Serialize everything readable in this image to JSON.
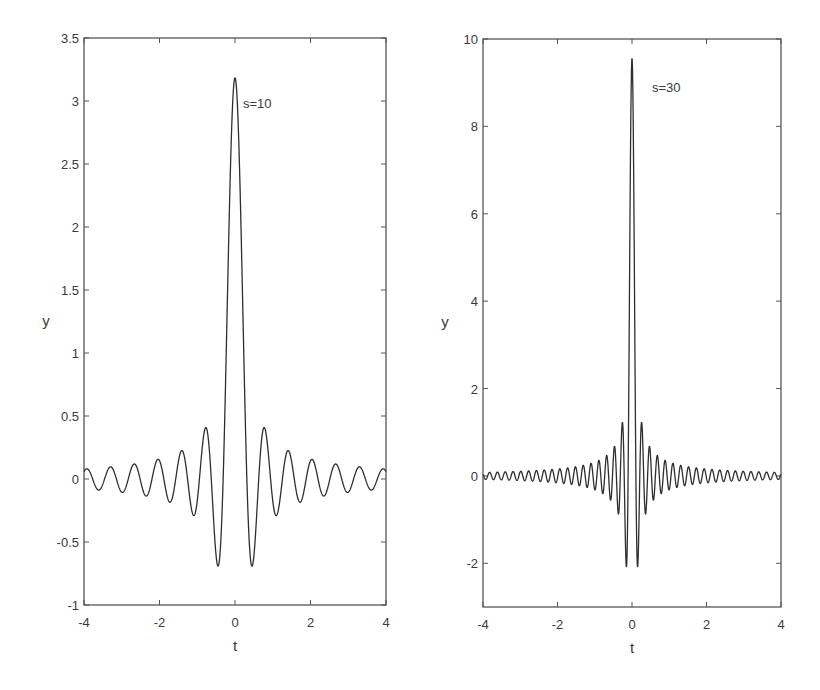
{
  "chart_data": [
    {
      "type": "line",
      "title": "",
      "annotation": "s=10",
      "xlabel": "t",
      "ylabel": "y",
      "xlim": [
        -4,
        4
      ],
      "ylim": [
        -1,
        3.5
      ],
      "xticks": [
        -4,
        -2,
        0,
        2,
        4
      ],
      "xtick_labels": [
        "-4",
        "-2",
        "0",
        "2",
        "4"
      ],
      "yticks": [
        -1,
        -0.5,
        0,
        0.5,
        1,
        1.5,
        2,
        2.5,
        3,
        3.5
      ],
      "ytick_labels": [
        "-1",
        "-0.5",
        "0",
        "0.5",
        "1",
        "1.5",
        "2",
        "2.5",
        "3",
        "3.5"
      ],
      "grid": false,
      "legend": null,
      "function": "y = sin(s*t)/(pi*t)",
      "s": 10,
      "series": [
        {
          "name": "s=10",
          "x": [
            -4,
            -3.5,
            -3,
            -2.5,
            -2,
            -1.5,
            -1.1,
            -0.75,
            -0.45,
            -0.3,
            -0.15,
            0,
            0.15,
            0.3,
            0.45,
            0.75,
            1.1,
            1.5,
            2,
            2.5,
            3,
            3.5,
            4
          ],
          "y": [
            0.06,
            -0.04,
            -0.104,
            -0.017,
            0.145,
            -0.138,
            -0.29,
            0.4,
            -0.7,
            0.15,
            2.12,
            3.18,
            2.12,
            0.15,
            -0.7,
            0.4,
            -0.29,
            -0.138,
            0.145,
            -0.017,
            -0.104,
            -0.04,
            0.06
          ]
        }
      ],
      "peak": {
        "t": 0,
        "y": 3.18
      },
      "first_minima": {
        "t": [
          -0.45,
          0.45
        ],
        "y": -0.7
      }
    },
    {
      "type": "line",
      "title": "",
      "annotation": "s=30",
      "xlabel": "t",
      "ylabel": "y",
      "xlim": [
        -4,
        4
      ],
      "ylim": [
        -3,
        10
      ],
      "xticks": [
        -4,
        -2,
        0,
        2,
        4
      ],
      "xtick_labels": [
        "-4",
        "-2",
        "0",
        "2",
        "4"
      ],
      "yticks": [
        -2,
        0,
        2,
        4,
        6,
        8,
        10
      ],
      "ytick_labels": [
        "-2",
        "0",
        "2",
        "4",
        "6",
        "8",
        "10"
      ],
      "grid": false,
      "legend": null,
      "function": "y = sin(s*t)/(pi*t)",
      "s": 30,
      "series": [
        {
          "name": "s=30",
          "x": [
            -4,
            -2,
            -1,
            -0.5,
            -0.36,
            -0.26,
            -0.15,
            -0.05,
            0,
            0.05,
            0.15,
            0.26,
            0.36,
            0.5,
            1,
            2,
            4
          ],
          "y": [
            -0.04,
            -0.05,
            -0.32,
            0.41,
            -0.87,
            1.2,
            -2.07,
            6.35,
            9.55,
            6.35,
            -2.07,
            1.2,
            -0.87,
            0.41,
            -0.32,
            -0.05,
            -0.04
          ]
        }
      ],
      "peak": {
        "t": 0,
        "y": 9.55
      },
      "first_minima": {
        "t": [
          -0.15,
          0.15
        ],
        "y": -2.07
      }
    }
  ],
  "plots": [
    {
      "box": {
        "left": 84,
        "top": 38,
        "right": 386,
        "bottom": 605
      },
      "annotation_pos": {
        "x": 243,
        "y": 108
      }
    },
    {
      "box": {
        "left": 483,
        "top": 39,
        "right": 781,
        "bottom": 607
      },
      "annotation_pos": {
        "x": 652,
        "y": 92
      }
    }
  ],
  "colors": {
    "line": "#2e2e2e",
    "axes": "#555555",
    "text": "#3a3a3a",
    "background": "#ffffff"
  }
}
